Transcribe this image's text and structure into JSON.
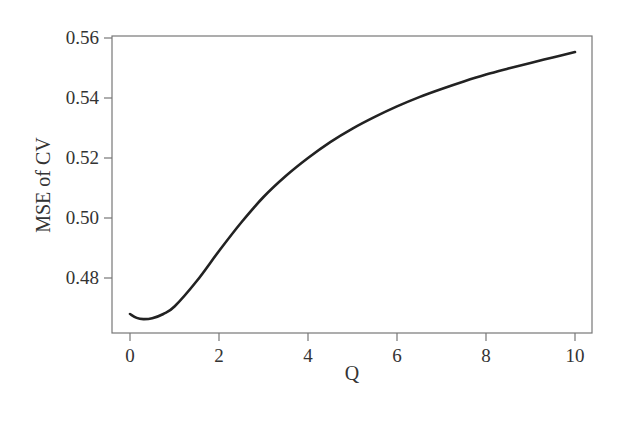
{
  "chart_data": {
    "type": "line",
    "title": "",
    "xlabel": "Q",
    "ylabel": "MSE of CV",
    "xlim": [
      -0.4,
      10.4
    ],
    "ylim": [
      0.4617,
      0.5607
    ],
    "grid": false,
    "legend": null,
    "x_ticks": [
      0,
      2,
      4,
      6,
      8,
      10
    ],
    "x_tick_labels": [
      "0",
      "2",
      "4",
      "6",
      "8",
      "10"
    ],
    "y_ticks": [
      0.48,
      0.5,
      0.52,
      0.54,
      0.56
    ],
    "y_tick_labels": [
      "0.48",
      "0.50",
      "0.52",
      "0.54",
      "0.56"
    ],
    "series": [
      {
        "name": "MSE of CV",
        "color": "#222222",
        "x": [
          0,
          0.15,
          0.3,
          0.5,
          0.75,
          1.0,
          1.5,
          2.0,
          2.5,
          3.0,
          3.5,
          4.0,
          4.5,
          5.0,
          5.5,
          6.0,
          6.5,
          7.0,
          7.5,
          8.0,
          8.5,
          9.0,
          9.5,
          10.0
        ],
        "y": [
          0.468,
          0.4667,
          0.4663,
          0.4666,
          0.468,
          0.4705,
          0.479,
          0.489,
          0.4985,
          0.507,
          0.514,
          0.52,
          0.5253,
          0.5298,
          0.5337,
          0.5372,
          0.5403,
          0.543,
          0.5455,
          0.5478,
          0.5498,
          0.5517,
          0.5535,
          0.5553
        ]
      }
    ]
  }
}
